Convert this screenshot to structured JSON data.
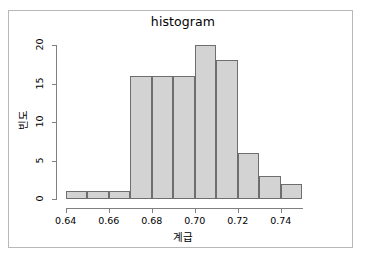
{
  "chart_data": {
    "type": "bar",
    "title": "histogram",
    "xlabel": "계급",
    "ylabel": "빈도",
    "bin_edges": [
      0.64,
      0.65,
      0.66,
      0.67,
      0.68,
      0.69,
      0.7,
      0.71,
      0.72,
      0.73,
      0.74,
      0.75
    ],
    "bin_width": 0.01,
    "categories": [
      "0.64-0.65",
      "0.65-0.66",
      "0.66-0.67",
      "0.67-0.68",
      "0.68-0.69",
      "0.69-0.70",
      "0.70-0.71",
      "0.71-0.72",
      "0.72-0.73",
      "0.73-0.74",
      "0.74-0.75"
    ],
    "values": [
      1,
      1,
      1,
      16,
      16,
      16,
      20,
      18,
      6,
      3,
      2
    ],
    "xlim": [
      0.6355,
      0.7545
    ],
    "ylim": [
      0,
      20
    ],
    "x_ticks": [
      0.64,
      0.66,
      0.68,
      0.7,
      0.72,
      0.74
    ],
    "x_tick_labels": [
      "0.64",
      "0.66",
      "0.68",
      "0.70",
      "0.72",
      "0.74"
    ],
    "y_ticks": [
      0,
      5,
      10,
      15,
      20
    ],
    "y_tick_labels": [
      "0",
      "5",
      "10",
      "15",
      "20"
    ],
    "grid": false,
    "legend": null,
    "colors": {
      "bar_fill": "#d3d3d3",
      "bar_border": "#6e6e6e",
      "axis": "#808080",
      "text": "#000000",
      "background": "#ffffff",
      "frame_border": "#b8b8b8"
    }
  }
}
